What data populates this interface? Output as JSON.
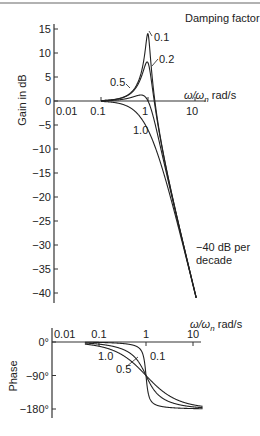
{
  "chart_data": [
    {
      "type": "line",
      "title": "",
      "ylabel": "Gain in dB",
      "xlabel": "ω/ωn rad/s",
      "xlabel_main": "ω/ω",
      "xlabel_sub": "n",
      "xlabel_unit": " rad/s",
      "xscale": "log",
      "xlim": [
        0.01,
        15
      ],
      "ylim": [
        -42,
        16
      ],
      "x_ticks": [
        0.01,
        0.1,
        1,
        10
      ],
      "x_tick_labels": [
        "0.01",
        "0.1",
        "1",
        "10"
      ],
      "y_ticks": [
        15,
        10,
        5,
        0,
        -5,
        -10,
        -15,
        -20,
        -25,
        -30,
        -35,
        -40
      ],
      "y_tick_labels": [
        "15",
        "10",
        "5",
        "0",
        "−5",
        "−10",
        "−15",
        "−20",
        "−25",
        "−30",
        "−35",
        "−40"
      ],
      "legend_title": "Damping factor",
      "series": [
        {
          "name": "0.1",
          "damping": 0.1
        },
        {
          "name": "0.2",
          "damping": 0.2
        },
        {
          "name": "0.5",
          "damping": 0.5
        },
        {
          "name": "1.0",
          "damping": 1.0
        }
      ],
      "annotations": [
        "−40 dB per",
        "decade"
      ],
      "grid": false
    },
    {
      "type": "line",
      "title": "",
      "ylabel": "Phase",
      "xlabel": "ω/ωn rad/s",
      "xlabel_main": "ω/ω",
      "xlabel_sub": "n",
      "xlabel_unit": " rad/s",
      "xscale": "log",
      "xlim": [
        0.01,
        15
      ],
      "ylim": [
        -180,
        0
      ],
      "x_ticks": [
        0.01,
        0.1,
        1,
        10
      ],
      "x_tick_labels": [
        "0.01",
        "0.1",
        "1",
        "10"
      ],
      "y_ticks": [
        0,
        -90,
        -180
      ],
      "y_tick_labels": [
        "0°",
        "−90°",
        "−180°"
      ],
      "series": [
        {
          "name": "0.1",
          "damping": 0.1
        },
        {
          "name": "0.5",
          "damping": 0.5
        },
        {
          "name": "1.0",
          "damping": 1.0
        },
        {
          "name": "0.2",
          "damping": 0.2
        }
      ],
      "series_labels_shown": [
        "1.0",
        "0.5",
        "0.1"
      ],
      "grid": false
    }
  ]
}
